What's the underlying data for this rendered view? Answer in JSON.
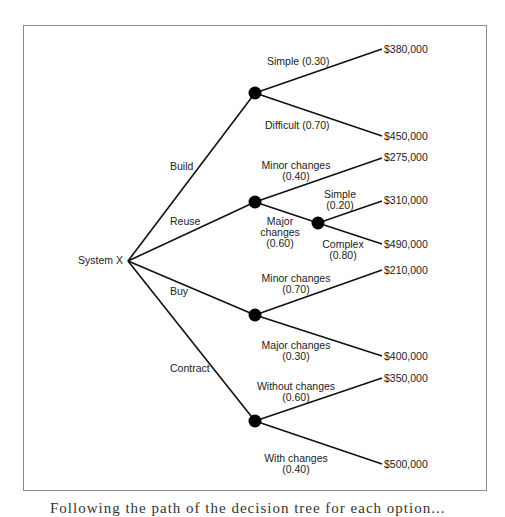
{
  "diagram": {
    "type": "decision-tree",
    "root": "System X",
    "branches": [
      {
        "label": "Build",
        "outcomes": [
          {
            "label": "Simple (0.30)",
            "value": "$380,000"
          },
          {
            "label": "Difficult (0.70)",
            "value": "$450,000"
          }
        ]
      },
      {
        "label": "Reuse",
        "outcomes": [
          {
            "label": "Minor changes",
            "prob": "(0.40)",
            "value": "$275,000"
          },
          {
            "label": "Major",
            "label2": "changes",
            "prob": "(0.60)",
            "outcomes": [
              {
                "label": "Simple",
                "prob": "(0.20)",
                "value": "$310,000"
              },
              {
                "label": "Complex",
                "prob": "(0.80)",
                "value": "$490,000"
              }
            ]
          }
        ]
      },
      {
        "label": "Buy",
        "outcomes": [
          {
            "label": "Minor changes",
            "prob": "(0.70)",
            "value": "$210,000"
          },
          {
            "label": "Major changes",
            "prob": "(0.30)",
            "value": "$400,000"
          }
        ]
      },
      {
        "label": "Contract",
        "outcomes": [
          {
            "label": "Without changes",
            "prob": "(0.60)",
            "value": "$350,000"
          },
          {
            "label": "With changes",
            "prob": "(0.40)",
            "value": "$500,000"
          }
        ]
      }
    ]
  },
  "caption": "Following the path of the decision tree for each option..."
}
